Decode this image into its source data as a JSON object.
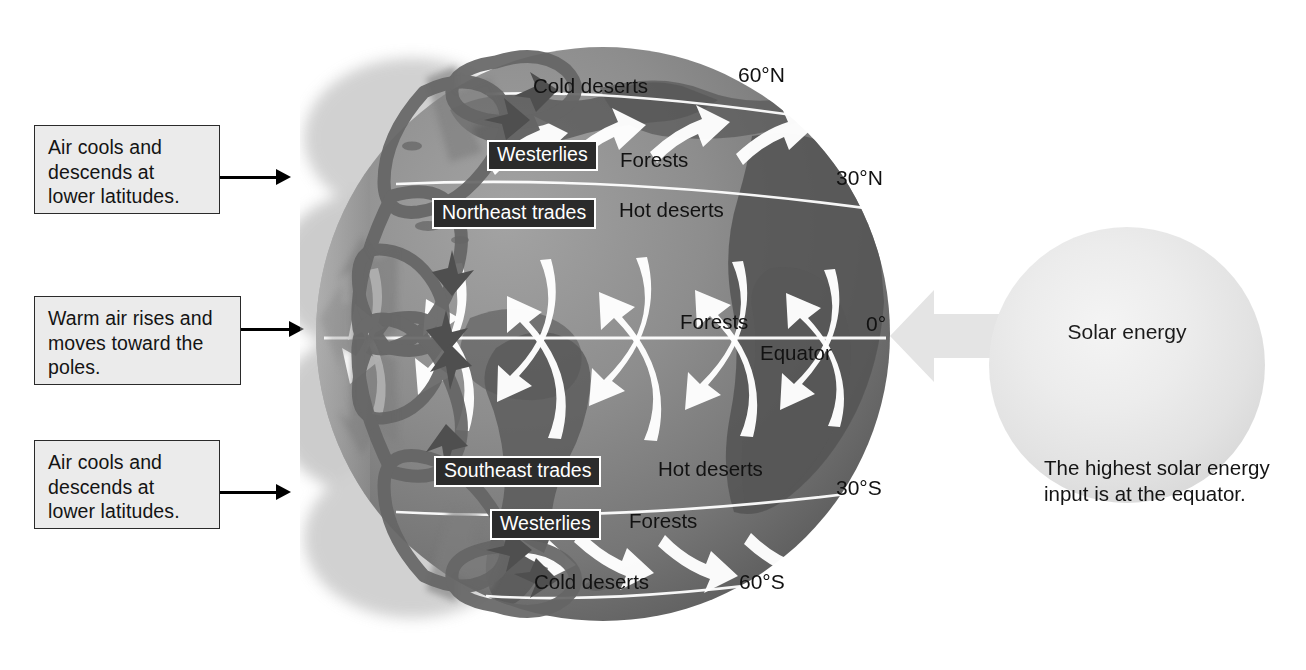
{
  "diagram": {
    "callouts": [
      {
        "id": "north-descend",
        "lines": [
          "Air cools and",
          "descends at",
          "lower latitudes."
        ]
      },
      {
        "id": "equator-rise",
        "lines": [
          "Warm air rises and",
          "moves toward the",
          "poles."
        ]
      },
      {
        "id": "south-descend",
        "lines": [
          "Air cools and",
          "descends at",
          "lower latitudes."
        ]
      }
    ],
    "latitudes": [
      {
        "id": "lat-60n",
        "label": "60°N"
      },
      {
        "id": "lat-30n",
        "label": "30°N"
      },
      {
        "id": "lat-0",
        "label": "0°"
      },
      {
        "id": "lat-30s",
        "label": "30°S"
      },
      {
        "id": "lat-60s",
        "label": "60°S"
      }
    ],
    "equator_label": "Equator",
    "wind_belts": [
      {
        "id": "westerlies-north",
        "label": "Westerlies"
      },
      {
        "id": "northeast-trades",
        "label": "Northeast trades"
      },
      {
        "id": "southeast-trades",
        "label": "Southeast trades"
      },
      {
        "id": "westerlies-south",
        "label": "Westerlies"
      }
    ],
    "biomes": [
      {
        "id": "cold-deserts-north",
        "label": "Cold deserts"
      },
      {
        "id": "forests-north-60",
        "label": "Forests"
      },
      {
        "id": "hot-deserts-north",
        "label": "Hot deserts"
      },
      {
        "id": "forests-equator",
        "label": "Forests"
      },
      {
        "id": "hot-deserts-south",
        "label": "Hot deserts"
      },
      {
        "id": "forests-south-30",
        "label": "Forests"
      },
      {
        "id": "cold-deserts-south",
        "label": "Cold deserts"
      }
    ],
    "sun": {
      "label": "Solar energy",
      "caption_lines": [
        "The highest solar energy",
        "input is at the equator."
      ]
    },
    "colors": {
      "ocean": "#8a8a8a",
      "land": "#5c5c5c",
      "cell_outline": "#6c6c6c",
      "cell_arrow": "#7b7b7b",
      "surface_wind": "#ffffff",
      "callout_fill": "#ebebeb",
      "callout_border": "#2a2a2a",
      "sun_fill": "#e8e8e8",
      "solar_arrow": "#e3e3e3",
      "latitude_line": "#ffffff"
    }
  }
}
